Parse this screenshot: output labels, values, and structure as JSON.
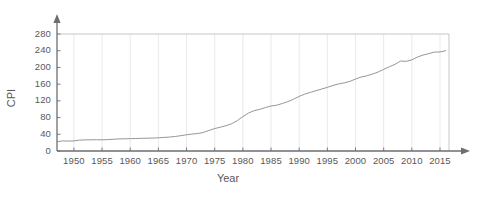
{
  "chart_data": {
    "type": "line",
    "title": "",
    "xlabel": "Year",
    "ylabel": "CPI",
    "xlim": [
      1947,
      2016
    ],
    "ylim": [
      0,
      280
    ],
    "xticks": [
      1950,
      1955,
      1960,
      1965,
      1970,
      1975,
      1980,
      1985,
      1990,
      1995,
      2000,
      2005,
      2010,
      2015
    ],
    "xtick_labels": [
      "1950",
      "1955",
      "1960",
      "1965",
      "1970",
      "1975",
      "1980",
      "1985",
      "1990",
      "1995",
      "2000",
      "2005",
      "2010",
      "2015"
    ],
    "yticks": [
      0,
      40,
      80,
      120,
      160,
      200,
      240,
      280
    ],
    "ytick_labels": [
      "0",
      "40",
      "80",
      "120",
      "160",
      "200",
      "240",
      "280"
    ],
    "grid": "faint-vertical-and-top",
    "legend": "none",
    "line_color": "#8a8a8a",
    "axis_color": "#6e6e70",
    "gridline_color": "#e9e9ee",
    "series": [
      {
        "name": "CPI",
        "x": [
          1947,
          1948,
          1949,
          1950,
          1951,
          1952,
          1953,
          1954,
          1955,
          1956,
          1957,
          1958,
          1959,
          1960,
          1961,
          1962,
          1963,
          1964,
          1965,
          1966,
          1967,
          1968,
          1969,
          1970,
          1971,
          1972,
          1973,
          1974,
          1975,
          1976,
          1977,
          1978,
          1979,
          1980,
          1981,
          1982,
          1983,
          1984,
          1985,
          1986,
          1987,
          1988,
          1989,
          1990,
          1991,
          1992,
          1993,
          1994,
          1995,
          1996,
          1997,
          1998,
          1999,
          2000,
          2001,
          2002,
          2003,
          2004,
          2005,
          2006,
          2007,
          2008,
          2009,
          2010,
          2011,
          2012,
          2013,
          2014,
          2015,
          2016
        ],
        "values": [
          22.3,
          24.1,
          23.8,
          24.1,
          26.0,
          26.6,
          26.8,
          26.9,
          26.8,
          27.2,
          28.1,
          28.9,
          29.2,
          29.6,
          29.9,
          30.3,
          30.6,
          31.0,
          31.5,
          32.5,
          33.4,
          34.8,
          36.7,
          38.8,
          40.5,
          41.8,
          44.4,
          49.3,
          53.8,
          56.9,
          60.6,
          65.2,
          72.6,
          82.4,
          90.9,
          96.5,
          99.6,
          103.9,
          107.6,
          109.6,
          113.6,
          118.3,
          124.0,
          130.7,
          136.2,
          140.3,
          144.5,
          148.2,
          152.4,
          156.9,
          160.5,
          163.0,
          166.6,
          172.2,
          177.1,
          179.9,
          184.0,
          188.9,
          195.3,
          201.6,
          207.3,
          215.3,
          214.5,
          218.1,
          224.9,
          229.6,
          233.0,
          236.7,
          237.0,
          240.0
        ]
      }
    ]
  }
}
